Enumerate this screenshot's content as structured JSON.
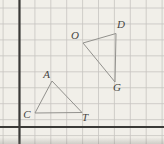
{
  "figure": {
    "width": 164,
    "height": 144,
    "background_color": "#f1efe9",
    "grid": {
      "color": "#c6c4c0",
      "stroke_width": 0.8,
      "first_x": 3.1,
      "spacing_x": 15.9,
      "vertical_count": 11,
      "first_y": 8,
      "spacing_y": 15.95,
      "horizontal_count": 9
    },
    "axes": {
      "color": "#3b3a37",
      "stroke_width": 2.2,
      "y_axis_x": 19.5,
      "x_axis_y": 127
    },
    "triangle_stroke": "#92918d",
    "triangle_stroke_width": 1,
    "label_color": "#45443f",
    "label_font_size": 11,
    "triangles": [
      {
        "name": "CAT",
        "vertices": [
          [
            35,
            113
          ],
          [
            52,
            81
          ],
          [
            82,
            112.5
          ]
        ]
      },
      {
        "name": "ODG",
        "vertices": [
          [
            83,
            43
          ],
          [
            116,
            33.5
          ],
          [
            115,
            82
          ]
        ]
      }
    ],
    "vertex_labels": [
      {
        "text": "A",
        "x": 46.5,
        "y": 78
      },
      {
        "text": "C",
        "x": 27,
        "y": 118
      },
      {
        "text": "T",
        "x": 85,
        "y": 121
      },
      {
        "text": "O",
        "x": 75,
        "y": 38.5
      },
      {
        "text": "D",
        "x": 121,
        "y": 28
      },
      {
        "text": "G",
        "x": 117,
        "y": 91
      }
    ]
  }
}
